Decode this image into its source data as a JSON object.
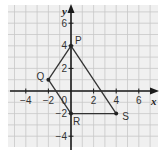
{
  "diagram": {
    "type": "coordinate-grid-quadrilateral",
    "axes": {
      "x_label": "x",
      "y_label": "y",
      "x_ticks": [
        -4,
        -2,
        2,
        4,
        6
      ],
      "y_ticks": [
        6,
        4,
        2,
        -2,
        -4
      ],
      "origin_label": "0",
      "x_range": [
        -5.5,
        7.7
      ],
      "y_range": [
        -5,
        7.6
      ]
    },
    "points": [
      {
        "name": "P",
        "x": 0,
        "y": 4
      },
      {
        "name": "Q",
        "x": -2,
        "y": 1
      },
      {
        "name": "R",
        "x": 0,
        "y": -2
      },
      {
        "name": "S",
        "x": 4,
        "y": -2
      }
    ],
    "segments": [
      [
        "Q",
        "P"
      ],
      [
        "P",
        "S"
      ],
      [
        "S",
        "R"
      ],
      [
        "R",
        "Q"
      ]
    ],
    "colors": {
      "background": "#f0f0f0",
      "grid": "#c8c8c8",
      "axis": "#1a1a1a",
      "shape": "#333333"
    }
  }
}
